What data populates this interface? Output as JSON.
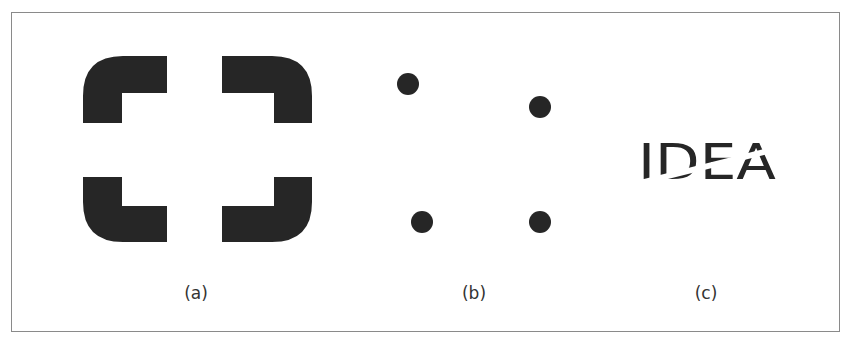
{
  "figure": {
    "panels": [
      {
        "id": "a",
        "caption": "(a)",
        "description": "Four rounded L-shaped corner brackets forming an illusory square"
      },
      {
        "id": "b",
        "caption": "(b)",
        "description": "Four dots arranged as corners of an implied quadrilateral"
      },
      {
        "id": "c",
        "caption": "(c)",
        "description": "The word IDEA with a diagonal cut through the letters",
        "word": "IDEA"
      }
    ],
    "colors": {
      "ink": "#262626",
      "border": "#8a8a8a",
      "background": "#ffffff"
    }
  }
}
